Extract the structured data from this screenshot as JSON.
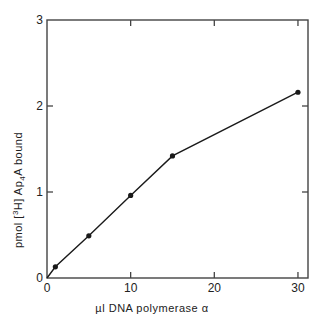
{
  "chart_data": {
    "type": "line",
    "title": "",
    "xlabel": "µl DNA polymerase α",
    "ylabel_parts": {
      "pre": "pmol [",
      "sup": "3",
      "mid": "H] Ap",
      "sub": "4",
      "post": "A bound"
    },
    "ylabel": "pmol [3H] Ap4A bound",
    "xlim": [
      0,
      31.2
    ],
    "ylim": [
      0,
      3
    ],
    "x_ticks": [
      0,
      10,
      20,
      30
    ],
    "x_tick_labels": [
      "0",
      "10",
      "20",
      "30"
    ],
    "y_ticks": [
      0,
      1,
      2,
      3
    ],
    "y_tick_labels": [
      "0",
      "1",
      "2",
      "3"
    ],
    "grid": false,
    "legend": null,
    "series": [
      {
        "name": "Ap4A bound",
        "marker": "filled-circle",
        "line": "solid",
        "color": "#1a1a1a",
        "x": [
          0,
          1,
          5,
          10,
          15,
          30
        ],
        "y": [
          0,
          0.13,
          0.49,
          0.96,
          1.42,
          2.16
        ]
      }
    ]
  },
  "colors": {
    "axis": "#444444",
    "line": "#1a1a1a",
    "text": "#222222",
    "background": "#ffffff"
  }
}
